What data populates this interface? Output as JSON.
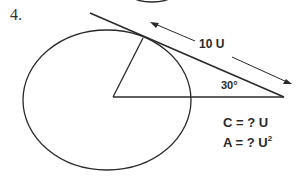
{
  "problem": {
    "number": "4.",
    "tangent_length_label": "10 U",
    "angle_label": "30°",
    "circumference_prompt": "C = ? U",
    "area_prompt_base": "A = ? U",
    "area_prompt_exponent": "2"
  },
  "colors": {
    "stroke": "#2a2a2a",
    "background": "#ffffff"
  }
}
